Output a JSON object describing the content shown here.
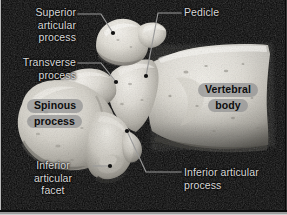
{
  "figure": {
    "background_color": "#050505",
    "bone_color_light": "#e8e6e0",
    "bone_color_mid": "#c3c0b8",
    "bone_color_shadow": "#6d6a63",
    "leader_color": "#9a9a9a",
    "label_text_color": "#d8d8d8",
    "boxed_label_bg": "#969696",
    "boxed_label_text_color": "#0d0d0d",
    "width": 287,
    "height": 215
  },
  "labels": [
    {
      "id": "superior-articular-process",
      "text_lines": [
        "Superior",
        "articular",
        "process"
      ],
      "style": "plain",
      "align": "right",
      "x": 8,
      "y": 6,
      "width": 68
    },
    {
      "id": "transverse-process",
      "text_lines": [
        "Transverse",
        "process"
      ],
      "style": "plain",
      "align": "right",
      "x": 4,
      "y": 56,
      "width": 72
    },
    {
      "id": "spinous-process",
      "text_lines": [
        "Spinous",
        "process"
      ],
      "style": "boxed",
      "align": "left",
      "x": 27,
      "y": 98,
      "width": 64
    },
    {
      "id": "inferior-articular-facet",
      "text_lines": [
        "Inferior",
        "articular",
        "facet"
      ],
      "style": "plain",
      "align": "center",
      "x": 16,
      "y": 159,
      "width": 74
    },
    {
      "id": "pedicle",
      "text_lines": [
        "Pedicle"
      ],
      "style": "plain",
      "align": "left",
      "x": 184,
      "y": 6,
      "width": 60
    },
    {
      "id": "vertebral-body",
      "text_lines": [
        "Vertebral",
        "body"
      ],
      "style": "boxed",
      "align": "center",
      "x": 192,
      "y": 82,
      "width": 72
    },
    {
      "id": "inferior-articular-process",
      "text_lines": [
        "Inferior articular",
        "process"
      ],
      "style": "plain",
      "align": "left",
      "x": 184,
      "y": 166,
      "width": 96
    }
  ],
  "leaders": [
    {
      "id": "leader-superior-articular-process",
      "polyline": "78,14 101,14 113,33",
      "dot": [
        113,
        33
      ]
    },
    {
      "id": "leader-transverse-process",
      "polyline": "78,63 101,63 116,82",
      "dot": [
        116,
        82
      ]
    },
    {
      "id": "leader-pedicle",
      "polyline": "181,13 158,13 146,76",
      "dot": [
        146,
        76
      ]
    },
    {
      "id": "leader-inferior-articular-facet",
      "polyline": "93,166 110,166",
      "dot": [
        110,
        166
      ]
    },
    {
      "id": "leader-inferior-articular-process",
      "polyline": "127,131 146,172 181,172",
      "dot": [
        127,
        131
      ]
    }
  ],
  "anatomy_parts": [
    {
      "id": "superior-articular-process",
      "name": "Superior articular process"
    },
    {
      "id": "transverse-process",
      "name": "Transverse process"
    },
    {
      "id": "spinous-process",
      "name": "Spinous process"
    },
    {
      "id": "inferior-articular-facet",
      "name": "Inferior articular facet"
    },
    {
      "id": "pedicle",
      "name": "Pedicle"
    },
    {
      "id": "vertebral-body",
      "name": "Vertebral body"
    },
    {
      "id": "inferior-articular-process",
      "name": "Inferior articular process"
    }
  ]
}
